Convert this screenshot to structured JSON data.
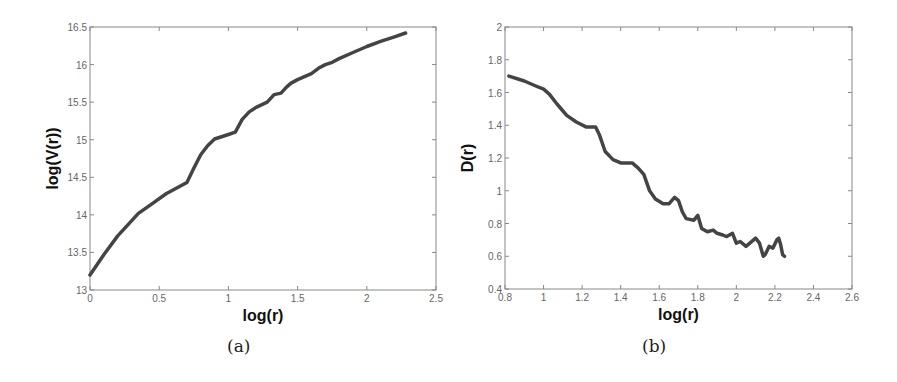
{
  "chart_data": [
    {
      "id": "a",
      "type": "line",
      "caption": "(a)",
      "title": "",
      "xlabel": "log(r)",
      "ylabel": "log(V(r))",
      "xlim": [
        0,
        2.5
      ],
      "ylim": [
        13,
        16.5
      ],
      "xticks": [
        0,
        0.5,
        1,
        1.5,
        2,
        2.5
      ],
      "xtick_labels": [
        "0",
        "0.5",
        "1",
        "1.5",
        "2",
        "2.5"
      ],
      "yticks": [
        13,
        13.5,
        14,
        14.5,
        15,
        15.5,
        16,
        16.5
      ],
      "ytick_labels": [
        "13",
        "13.5",
        "14",
        "14.5",
        "15",
        "15.5",
        "16",
        "16.5"
      ],
      "grid": false,
      "line_color": "#444444",
      "series": [
        {
          "name": "log(V(r))",
          "x": [
            0,
            0.1,
            0.2,
            0.35,
            0.45,
            0.55,
            0.7,
            0.75,
            0.8,
            0.85,
            0.9,
            1.0,
            1.05,
            1.1,
            1.15,
            1.2,
            1.28,
            1.33,
            1.38,
            1.42,
            1.45,
            1.5,
            1.55,
            1.6,
            1.65,
            1.7,
            1.75,
            1.8,
            1.9,
            2.0,
            2.1,
            2.2,
            2.28
          ],
          "y": [
            13.2,
            13.47,
            13.72,
            14.02,
            14.15,
            14.28,
            14.43,
            14.62,
            14.8,
            14.92,
            15.01,
            15.07,
            15.1,
            15.27,
            15.37,
            15.43,
            15.5,
            15.6,
            15.62,
            15.7,
            15.75,
            15.8,
            15.84,
            15.88,
            15.95,
            16.0,
            16.03,
            16.08,
            16.16,
            16.24,
            16.31,
            16.37,
            16.42
          ]
        }
      ]
    },
    {
      "id": "b",
      "type": "line",
      "caption": "(b)",
      "title": "",
      "xlabel": "log(r)",
      "ylabel": "D(r)",
      "xlim": [
        0.8,
        2.6
      ],
      "ylim": [
        0.4,
        2
      ],
      "xticks": [
        0.8,
        1,
        1.2,
        1.4,
        1.6,
        1.8,
        2,
        2.2,
        2.4,
        2.6
      ],
      "xtick_labels": [
        "0.8",
        "1",
        "1.2",
        "1.4",
        "1.6",
        "1.8",
        "2",
        "2.2",
        "2.4",
        "2.6"
      ],
      "yticks": [
        0.4,
        0.6,
        0.8,
        1,
        1.2,
        1.4,
        1.6,
        1.8,
        2
      ],
      "ytick_labels": [
        "0.4",
        "0.6",
        "0.8",
        "1",
        "1.2",
        "1.4",
        "1.6",
        "1.8",
        "2"
      ],
      "grid": false,
      "line_color": "#444444",
      "series": [
        {
          "name": "D(r)",
          "x": [
            0.82,
            0.9,
            0.96,
            1.0,
            1.03,
            1.07,
            1.12,
            1.17,
            1.22,
            1.25,
            1.27,
            1.29,
            1.32,
            1.36,
            1.4,
            1.43,
            1.46,
            1.49,
            1.52,
            1.55,
            1.58,
            1.62,
            1.65,
            1.68,
            1.7,
            1.72,
            1.74,
            1.78,
            1.8,
            1.82,
            1.85,
            1.88,
            1.9,
            1.93,
            1.95,
            1.98,
            2.0,
            2.02,
            2.05,
            2.07,
            2.1,
            2.12,
            2.14,
            2.15,
            2.17,
            2.19,
            2.21,
            2.22,
            2.23,
            2.24,
            2.25
          ],
          "y": [
            1.7,
            1.67,
            1.64,
            1.62,
            1.59,
            1.53,
            1.46,
            1.42,
            1.39,
            1.39,
            1.39,
            1.34,
            1.24,
            1.19,
            1.17,
            1.17,
            1.17,
            1.14,
            1.1,
            1.0,
            0.95,
            0.92,
            0.92,
            0.96,
            0.94,
            0.87,
            0.83,
            0.82,
            0.85,
            0.77,
            0.75,
            0.76,
            0.74,
            0.73,
            0.72,
            0.74,
            0.68,
            0.69,
            0.66,
            0.68,
            0.71,
            0.68,
            0.6,
            0.61,
            0.66,
            0.65,
            0.7,
            0.71,
            0.67,
            0.61,
            0.6
          ]
        }
      ]
    }
  ]
}
